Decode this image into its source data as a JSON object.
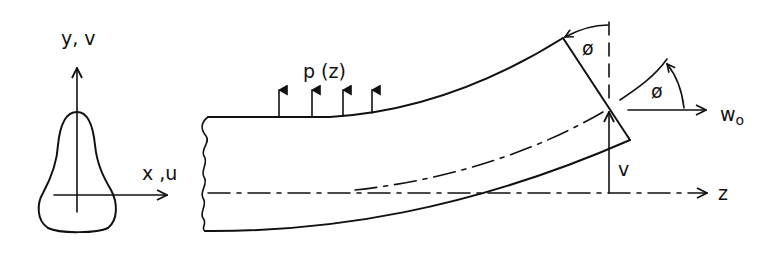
{
  "diagram": {
    "type": "beam-bending-schematic",
    "cross_section": {
      "vertical_axis_label": "y, v",
      "horizontal_axis_label": "x ,u"
    },
    "beam": {
      "load_label": "p (z)",
      "load_arrow_count": 4,
      "longitudinal_axis_label": "z",
      "deflection_label": "v",
      "rotation_label_top": "ø",
      "rotation_label_right": "ø",
      "axial_displacement_label": "w",
      "axial_displacement_subscript": "o"
    },
    "colors": {
      "stroke": "#111111",
      "background": "#ffffff"
    }
  }
}
